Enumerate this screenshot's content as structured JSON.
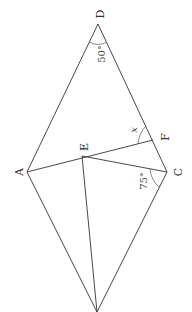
{
  "figure": {
    "type": "geometry",
    "orientation": "rotated 90 degrees clockwise",
    "points": {
      "D": {
        "label": "D",
        "x": 98,
        "y": 24
      },
      "A": {
        "label": "A",
        "x": 27,
        "y": 172
      },
      "C": {
        "label": "C",
        "x": 167,
        "y": 172
      },
      "F": {
        "label": "F",
        "x": 153,
        "y": 140
      },
      "E": {
        "label": "E",
        "x": 82,
        "y": 156
      },
      "B": {
        "x": 97,
        "y": 312
      }
    },
    "segments": [
      [
        "D",
        "A"
      ],
      [
        "D",
        "C"
      ],
      [
        "A",
        "B"
      ],
      [
        "C",
        "B"
      ],
      [
        "A",
        "F"
      ],
      [
        "E",
        "C"
      ],
      [
        "E",
        "B"
      ]
    ],
    "angles": {
      "D": {
        "value": "50°"
      },
      "C": {
        "value": "75°"
      },
      "F": {
        "value": "x"
      }
    }
  }
}
